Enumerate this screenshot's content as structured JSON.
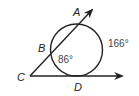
{
  "diagram": {
    "type": "geometry",
    "points": {
      "A": "A",
      "B": "B",
      "C": "C",
      "D": "D"
    },
    "arcs": {
      "minor_arc_BD": "86°",
      "major_arc_AD": "166°"
    },
    "colors": {
      "stroke": "#222222",
      "label": "#222222",
      "measure": "#444444"
    }
  }
}
